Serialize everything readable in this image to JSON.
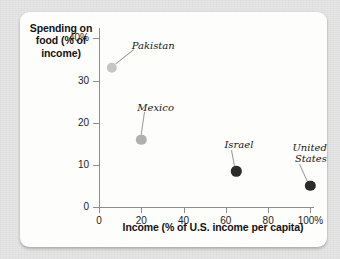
{
  "figure": {
    "background_color": "#fdfdfc",
    "page_color": "#e4e4e4"
  },
  "chart_data": {
    "type": "scatter",
    "title": "",
    "xlabel": "Income (% of U.S. income per capita)",
    "ylabel_lines": [
      "Spending on",
      "food (% of",
      "income)"
    ],
    "ylabel": "Spending on food (% of income)",
    "xlim": [
      0,
      105
    ],
    "ylim": [
      0,
      42
    ],
    "xticks": [
      0,
      20,
      40,
      60,
      80,
      100
    ],
    "xtick_labels": [
      "0",
      "20",
      "40",
      "60",
      "80",
      "100%"
    ],
    "yticks": [
      0,
      10,
      20,
      30,
      40
    ],
    "ytick_labels": [
      "0",
      "10",
      "20",
      "30",
      "40%"
    ],
    "grid": false,
    "legend": "none",
    "points": [
      {
        "name": "Pakistan",
        "label_lines": [
          "Pakistan"
        ],
        "x": 6,
        "y": 33,
        "color": "#c6c6c6",
        "radius": 5.2
      },
      {
        "name": "Mexico",
        "label_lines": [
          "Mexico"
        ],
        "x": 20,
        "y": 16,
        "color": "#b0b0b0",
        "radius": 5.2
      },
      {
        "name": "Israel",
        "label_lines": [
          "Israel"
        ],
        "x": 65,
        "y": 8.5,
        "color": "#2b2b2b",
        "radius": 5.2
      },
      {
        "name": "United States",
        "label_lines": [
          "United",
          "States"
        ],
        "x": 100,
        "y": 5,
        "color": "#2b2b2b",
        "radius": 5.2
      }
    ]
  }
}
